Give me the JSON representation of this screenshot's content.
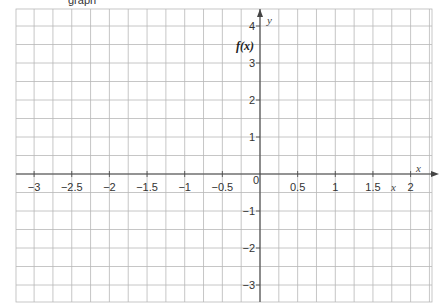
{
  "header": {
    "cut_text": "graph"
  },
  "chart_data": {
    "type": "line",
    "title": "",
    "xlabel": "x",
    "ylabel": "y",
    "function_label": "f(x)",
    "xlim": [
      -3.25,
      2.25
    ],
    "ylim": [
      -3.5,
      4.5
    ],
    "grid": true,
    "grid_spacing": {
      "x": 0.25,
      "y": 0.5
    },
    "x_ticks": [
      -3,
      -2.5,
      -2,
      -1.5,
      -1,
      -0.5,
      0.5,
      1,
      1.5,
      2
    ],
    "x_tick_labels": [
      "−3",
      "−2.5",
      "−2",
      "−1.5",
      "−1",
      "−0.5",
      "0.5",
      "1",
      "1.5",
      "2"
    ],
    "y_ticks": [
      -3,
      -2,
      -1,
      1,
      2,
      3,
      4
    ],
    "y_tick_labels": [
      "−3",
      "−2",
      "−1",
      "1",
      "2",
      "3",
      "4"
    ],
    "origin_label": "0",
    "series": []
  },
  "colors": {
    "grid": "#b8b8b8",
    "axis": "#444444",
    "background": "#ffffff"
  }
}
